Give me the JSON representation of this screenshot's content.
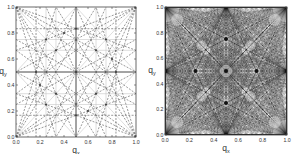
{
  "chart_data": [
    {
      "type": "line",
      "title": "",
      "xlabel": "q_x",
      "ylabel": "q_y",
      "xlim": [
        0.0,
        1.0
      ],
      "ylim": [
        0.0,
        1.0
      ],
      "xticks": [
        "0.0",
        "0.2",
        "0.4",
        "0.6",
        "0.8",
        "1.0"
      ],
      "yticks": [
        "0.0",
        "0.2",
        "0.4",
        "0.6",
        "0.8",
        "1.0"
      ],
      "grid": false,
      "description": "Symmetric pattern of lines in the unit square: solid vertical/horizontal lines at q=0.5, dashed lines connecting rational points (1/2, 1/3, 2/3, 1/4, 3/4) to corners and edges, light gray dotted lines at quarter positions.",
      "solid_lines": [
        [
          0.5,
          0,
          0.5,
          1
        ],
        [
          0,
          0.5,
          1,
          0.5
        ]
      ],
      "light_lines": [
        [
          0,
          0,
          1,
          1
        ],
        [
          0,
          1,
          1,
          0
        ],
        [
          0.25,
          0,
          0.25,
          1
        ],
        [
          0.75,
          0,
          0.75,
          1
        ],
        [
          0,
          0.25,
          1,
          0.25
        ],
        [
          0,
          0.75,
          1,
          0.75
        ],
        [
          0,
          0.5,
          0.5,
          1
        ],
        [
          0.5,
          1,
          1,
          0.5
        ],
        [
          1,
          0.5,
          0.5,
          0
        ],
        [
          0.5,
          0,
          0,
          0.5
        ],
        [
          0.333,
          0,
          0.333,
          1
        ],
        [
          0.667,
          0,
          0.667,
          1
        ],
        [
          0,
          0.333,
          1,
          0.333
        ],
        [
          0,
          0.667,
          1,
          0.667
        ]
      ],
      "dashed_lines": [
        [
          0,
          0,
          0.5,
          1
        ],
        [
          0,
          0,
          1,
          0.5
        ],
        [
          1,
          1,
          0.5,
          0
        ],
        [
          1,
          1,
          0,
          0.5
        ],
        [
          0,
          1,
          0.5,
          0
        ],
        [
          0,
          1,
          1,
          0.5
        ],
        [
          1,
          0,
          0.5,
          1
        ],
        [
          1,
          0,
          0,
          0.5
        ],
        [
          0,
          0,
          0.333,
          1
        ],
        [
          0,
          0,
          1,
          0.333
        ],
        [
          0,
          0,
          0.667,
          1
        ],
        [
          0,
          0,
          1,
          0.667
        ],
        [
          1,
          1,
          0.667,
          0
        ],
        [
          1,
          1,
          0,
          0.667
        ],
        [
          1,
          1,
          0.333,
          0
        ],
        [
          1,
          1,
          0,
          0.333
        ],
        [
          0,
          1,
          0.333,
          0
        ],
        [
          0,
          1,
          1,
          0.667
        ],
        [
          0,
          1,
          0.667,
          0
        ],
        [
          0,
          1,
          1,
          0.333
        ],
        [
          1,
          0,
          0.667,
          1
        ],
        [
          1,
          0,
          0,
          0.333
        ],
        [
          1,
          0,
          0.333,
          1
        ],
        [
          1,
          0,
          0,
          0.667
        ],
        [
          0.25,
          0,
          0.75,
          1
        ],
        [
          0.75,
          0,
          0.25,
          1
        ],
        [
          0,
          0.25,
          1,
          0.75
        ],
        [
          0,
          0.75,
          1,
          0.25
        ],
        [
          0,
          0.167,
          1,
          0.167
        ],
        [
          0,
          0.833,
          1,
          0.833
        ],
        [
          0.167,
          0,
          0.167,
          1
        ],
        [
          0.833,
          0,
          0.833,
          1
        ]
      ]
    },
    {
      "type": "line",
      "title": "",
      "xlabel": "q_x",
      "ylabel": "q_y",
      "xlim": [
        0.0,
        1.0
      ],
      "ylim": [
        0.0,
        1.0
      ],
      "xticks": [
        "0.0",
        "0.2",
        "0.4",
        "0.6",
        "0.8",
        "1.0"
      ],
      "yticks": [
        "0.0",
        "0.2",
        "0.4",
        "0.6",
        "0.8",
        "1.0"
      ],
      "grid": false,
      "description": "Dense symmetric network of lines filling the unit square, with light hollow regions near (0.5,0.5), (0.25,0.25), (0.75,0.75) etc. and dense dark nodes at the center and edge midpoints.",
      "density_orders": 8
    }
  ],
  "labels": {
    "x_axis": "q",
    "x_sub": "x",
    "y_axis": "q",
    "y_sub": "y"
  }
}
